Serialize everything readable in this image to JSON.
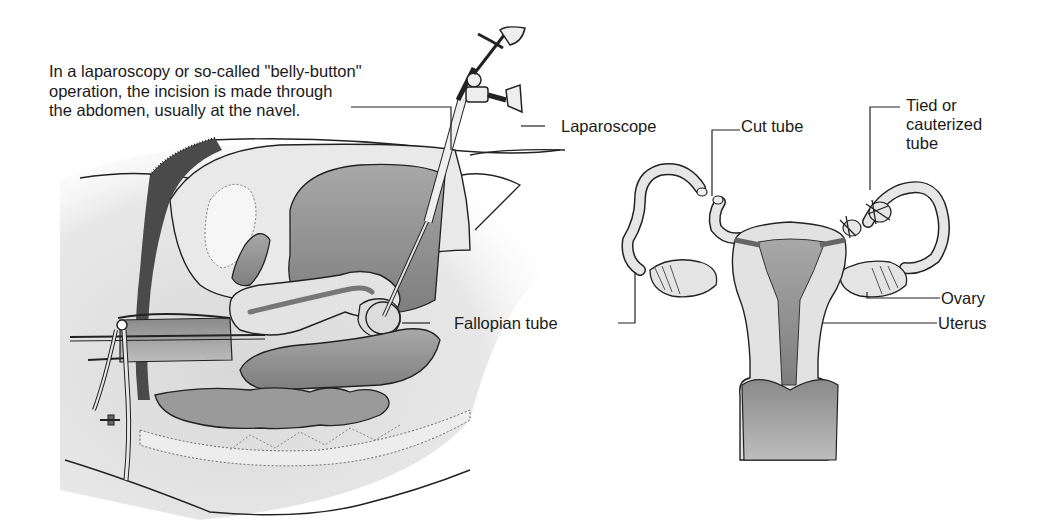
{
  "diagram": {
    "caption": {
      "lines": [
        "In a laparoscopy or so-called \"belly-button\"",
        "operation, the incision is made through",
        "the abdomen, usually at the navel."
      ]
    },
    "labels": {
      "laparoscope": "Laparoscope",
      "cut_tube": "Cut tube",
      "tied_tube": [
        "Tied or",
        "cauterized",
        "tube"
      ],
      "fallopian_tube": "Fallopian tube",
      "ovary": "Ovary",
      "uterus": "Uterus"
    },
    "panels": {
      "left": "sagittal-section-laparoscopy",
      "right": "uterus-frontal-view-tubal-ligation"
    },
    "colors": {
      "ink": "#1a1a1a",
      "tissue_light": "#e6e6e6",
      "tissue_mid": "#c9c9c9",
      "tissue_dark": "#8f8f8f",
      "background": "#ffffff"
    }
  }
}
